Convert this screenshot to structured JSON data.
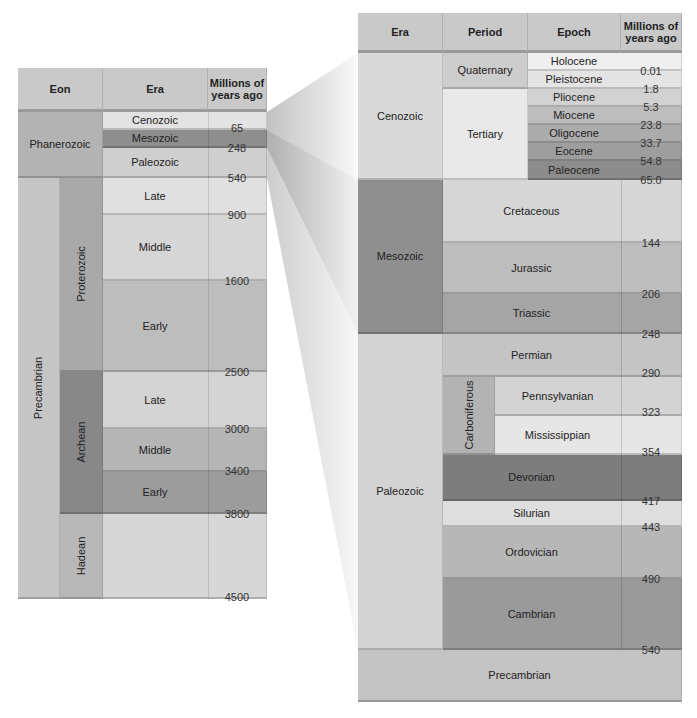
{
  "left_table": {
    "headers": {
      "eon": "Eon",
      "era": "Era",
      "mya": "Millions of years ago"
    },
    "eons": [
      {
        "label": "Phanerozoic"
      },
      {
        "label": "Precambrian"
      }
    ],
    "sub_eons": [
      {
        "label": "Proterozoic"
      },
      {
        "label": "Archean"
      },
      {
        "label": "Hadean"
      }
    ],
    "eras": [
      {
        "label": "Cenozoic"
      },
      {
        "label": "Mesozoic"
      },
      {
        "label": "Paleozoic"
      },
      {
        "label": "Late"
      },
      {
        "label": "Middle"
      },
      {
        "label": "Early"
      },
      {
        "label": "Late"
      },
      {
        "label": "Middle"
      },
      {
        "label": "Early"
      },
      {
        "label": ""
      }
    ],
    "boundaries": [
      "65",
      "248",
      "540",
      "900",
      "1600",
      "2500",
      "3000",
      "3400",
      "3800",
      "4500"
    ]
  },
  "right_table": {
    "headers": {
      "era": "Era",
      "period": "Period",
      "epoch": "Epoch",
      "mya": "Millions of years ago"
    },
    "eras": [
      {
        "label": "Cenozoic"
      },
      {
        "label": "Mesozoic"
      },
      {
        "label": "Paleozoic"
      }
    ],
    "periods": [
      {
        "label": "Quaternary"
      },
      {
        "label": "Tertiary"
      },
      {
        "label": "Cretaceous"
      },
      {
        "label": "Jurassic"
      },
      {
        "label": "Triassic"
      },
      {
        "label": "Permian"
      },
      {
        "label": "Carboniferous"
      },
      {
        "label": "Devonian"
      },
      {
        "label": "Silurian"
      },
      {
        "label": "Ordovician"
      },
      {
        "label": "Cambrian"
      }
    ],
    "epochs": [
      {
        "label": "Holocene"
      },
      {
        "label": "Pleistocene"
      },
      {
        "label": "Pliocene"
      },
      {
        "label": "Miocene"
      },
      {
        "label": "Oligocene"
      },
      {
        "label": "Eocene"
      },
      {
        "label": "Paleocene"
      },
      {
        "label": "Pennsylvanian"
      },
      {
        "label": "Mississippian"
      }
    ],
    "boundaries": [
      "0.01",
      "1.8",
      "5.3",
      "23.8",
      "33.7",
      "54.8",
      "65.0",
      "144",
      "206",
      "248",
      "290",
      "323",
      "354",
      "417",
      "443",
      "490",
      "540"
    ],
    "footer": "Precambrian"
  }
}
